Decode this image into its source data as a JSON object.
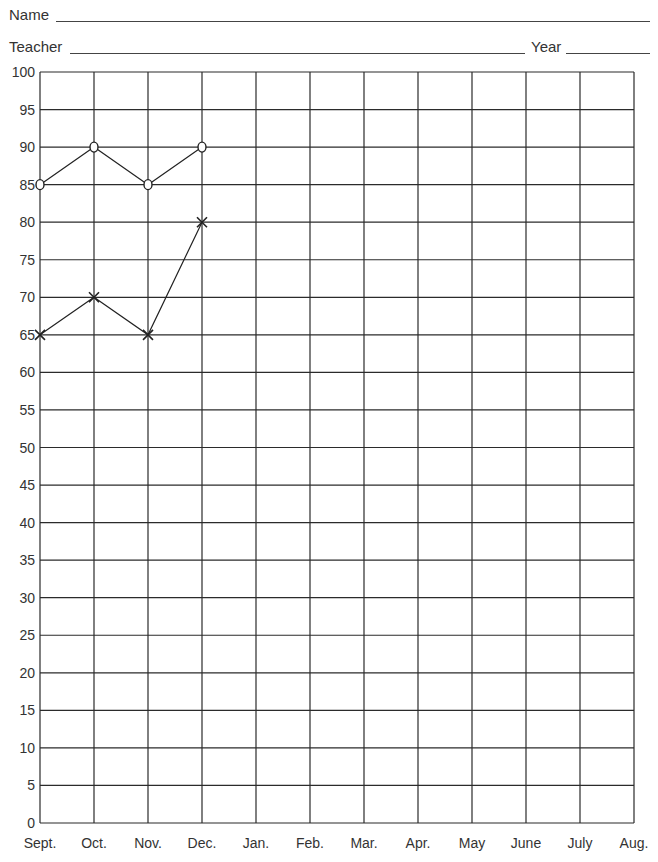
{
  "form": {
    "name_label": "Name",
    "teacher_label": "Teacher",
    "year_label": "Year"
  },
  "chart_data": {
    "type": "line",
    "title": "",
    "xlabel": "",
    "ylabel": "",
    "categories": [
      "Sept.",
      "Oct.",
      "Nov.",
      "Dec.",
      "Jan.",
      "Feb.",
      "Mar.",
      "Apr.",
      "May",
      "June",
      "July",
      "Aug."
    ],
    "yticks": [
      0,
      5,
      10,
      15,
      20,
      25,
      30,
      35,
      40,
      45,
      50,
      55,
      60,
      65,
      70,
      75,
      80,
      85,
      90,
      95,
      100
    ],
    "ylim": [
      0,
      100
    ],
    "grid": true,
    "legend": null,
    "series": [
      {
        "name": "O series",
        "marker": "o",
        "values": [
          85,
          90,
          85,
          90,
          null,
          null,
          null,
          null,
          null,
          null,
          null,
          null
        ]
      },
      {
        "name": "X series",
        "marker": "x",
        "values": [
          65,
          70,
          65,
          80,
          null,
          null,
          null,
          null,
          null,
          null,
          null,
          null
        ]
      }
    ]
  },
  "colors": {
    "grid": "#2b2b2b",
    "line": "#222222",
    "text": "#333333"
  }
}
